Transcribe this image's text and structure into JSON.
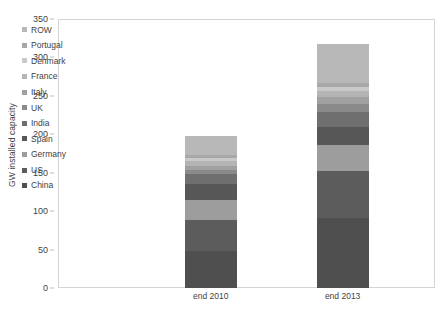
{
  "chart_data": {
    "type": "bar",
    "stacked": true,
    "title": "",
    "xlabel": "",
    "ylabel": "GW installed capacity",
    "ylim": [
      0,
      350
    ],
    "yticks": [
      0,
      50,
      100,
      150,
      200,
      250,
      300,
      350
    ],
    "grid": false,
    "legend_position": "inside-top-left",
    "categories": [
      "end 2010",
      "end 2013"
    ],
    "series": [
      {
        "name": "China",
        "color": "#4f4f4f",
        "values": [
          48,
          91
        ]
      },
      {
        "name": "US",
        "color": "#5c5c5c",
        "values": [
          40,
          61
        ]
      },
      {
        "name": "Germany",
        "color": "#9d9d9d",
        "values": [
          27,
          34
        ]
      },
      {
        "name": "Spain",
        "color": "#575757",
        "values": [
          20,
          23
        ]
      },
      {
        "name": "India",
        "color": "#6f6f6f",
        "values": [
          13,
          20
        ]
      },
      {
        "name": "UK",
        "color": "#8a8a8a",
        "values": [
          5,
          11
        ]
      },
      {
        "name": "Italy",
        "color": "#a0a0a0",
        "values": [
          6,
          9
        ]
      },
      {
        "name": "France",
        "color": "#b4b4b4",
        "values": [
          6,
          8
        ]
      },
      {
        "name": "Denmark",
        "color": "#c9c9c9",
        "values": [
          4,
          5
        ]
      },
      {
        "name": "Portugal",
        "color": "#a8a8a8",
        "values": [
          4,
          5
        ]
      },
      {
        "name": "ROW",
        "color": "#b8b8b8",
        "values": [
          25,
          51
        ]
      }
    ],
    "totals": [
      198,
      318
    ]
  },
  "legend": {
    "items": [
      {
        "label": "ROW"
      },
      {
        "label": "Portugal"
      },
      {
        "label": "Denmark"
      },
      {
        "label": "France"
      },
      {
        "label": "Italy"
      },
      {
        "label": "UK"
      },
      {
        "label": "India"
      },
      {
        "label": "Spain"
      },
      {
        "label": "Germany"
      },
      {
        "label": "US"
      },
      {
        "label": "China"
      }
    ]
  }
}
